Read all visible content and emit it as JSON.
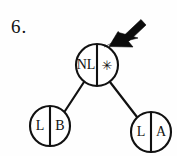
{
  "figure": {
    "label": "6.",
    "background_color": "#fefefe",
    "ink_color": "#111111",
    "type": "binary-tree-diagram"
  },
  "tree": {
    "root": {
      "id": "root",
      "left_cell": "NL",
      "right_cell": "✳",
      "right_cell_name": "star-glyph",
      "center": {
        "x": 97,
        "y": 65
      },
      "radius": 21
    },
    "children": [
      {
        "id": "left-child",
        "left_cell": "L",
        "right_cell": "B",
        "center": {
          "x": 50,
          "y": 126
        },
        "radius": 20
      },
      {
        "id": "right-child",
        "left_cell": "L",
        "right_cell": "A",
        "center": {
          "x": 151,
          "y": 132
        },
        "radius": 20
      }
    ],
    "edges": [
      {
        "from": "root",
        "to": "left-child",
        "x1": 84,
        "y1": 82,
        "x2": 65,
        "y2": 111
      },
      {
        "from": "root",
        "to": "right-child",
        "x1": 110,
        "y1": 82,
        "x2": 137,
        "y2": 117
      }
    ]
  },
  "annotation": {
    "arrow": {
      "name": "pointer-arrow",
      "points_to": "root.right_cell",
      "tip": {
        "x": 109,
        "y": 46
      },
      "tail": {
        "x": 145,
        "y": 18
      },
      "color": "#0c0c0c"
    }
  }
}
